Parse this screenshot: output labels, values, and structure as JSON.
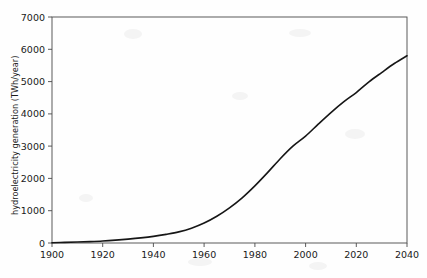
{
  "figure": {
    "background_color": "#fefefe",
    "plot_area": {
      "left": 52,
      "top": 17,
      "right": 407,
      "bottom": 243
    }
  },
  "chart_data": {
    "type": "line",
    "title": "",
    "subtitle": "",
    "xlabel": "",
    "ylabel": "hydroelectricity generation (TWh/year)",
    "xlim": [
      1900,
      2040
    ],
    "ylim": [
      0,
      7000
    ],
    "xticks": [
      1900,
      1920,
      1940,
      1960,
      1980,
      2000,
      2020,
      2040
    ],
    "xticklabels": [
      "1900",
      "1920",
      "1940",
      "1960",
      "1980",
      "2000",
      "2020",
      "2040"
    ],
    "yticks": [
      0,
      1000,
      2000,
      3000,
      4000,
      5000,
      6000,
      7000
    ],
    "yticklabels": [
      "0",
      "1000",
      "2000",
      "3000",
      "4000",
      "5000",
      "6000",
      "7000"
    ],
    "grid": false,
    "legend": null,
    "legend_position": "none",
    "line_color": "#161616",
    "line_width": 1.6,
    "series": [
      {
        "name": "hydroelectricity generation",
        "x": [
          1900,
          1905,
          1910,
          1915,
          1920,
          1925,
          1930,
          1935,
          1940,
          1945,
          1950,
          1955,
          1960,
          1965,
          1970,
          1975,
          1980,
          1985,
          1990,
          1995,
          2000,
          2005,
          2010,
          2015,
          2020,
          2025,
          2030,
          2035,
          2040
        ],
        "y": [
          10,
          18,
          30,
          44,
          62,
          88,
          120,
          158,
          205,
          268,
          345,
          460,
          620,
          830,
          1090,
          1400,
          1770,
          2180,
          2610,
          3000,
          3310,
          3680,
          4040,
          4370,
          4660,
          4990,
          5280,
          5560,
          5800
        ]
      }
    ]
  }
}
